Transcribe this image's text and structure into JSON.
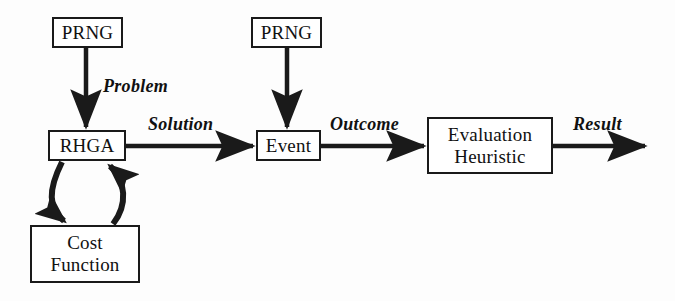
{
  "diagram": {
    "background_color": "#fdfdfd",
    "stroke_color": "#1a1a1a",
    "text_color": "#111111",
    "nodes": [
      {
        "id": "prng-1",
        "lines": [
          "PRNG"
        ],
        "x": 52,
        "y": 17,
        "w": 71,
        "h": 31
      },
      {
        "id": "prng-2",
        "lines": [
          "PRNG"
        ],
        "x": 251,
        "y": 17,
        "w": 71,
        "h": 31
      },
      {
        "id": "rhga",
        "lines": [
          "RHGA"
        ],
        "x": 48,
        "y": 130,
        "w": 78,
        "h": 31
      },
      {
        "id": "event",
        "lines": [
          "Event"
        ],
        "x": 256,
        "y": 130,
        "w": 65,
        "h": 31
      },
      {
        "id": "eval",
        "lines": [
          "Evaluation",
          "Heuristic"
        ],
        "x": 427,
        "y": 117,
        "w": 126,
        "h": 57
      },
      {
        "id": "cost",
        "lines": [
          "Cost",
          "Function"
        ],
        "x": 30,
        "y": 225,
        "w": 110,
        "h": 58
      }
    ],
    "node_labels": {
      "prng_1": "PRNG",
      "prng_2": "PRNG",
      "rhga": "RHGA",
      "event": "Event",
      "eval_line_1": "Evaluation",
      "eval_line_2": "Heuristic",
      "cost_line_1": "Cost",
      "cost_line_2": "Function"
    },
    "edge_labels": {
      "problem": "Problem",
      "solution": "Solution",
      "outcome": "Outcome",
      "result": "Result"
    },
    "edges": [
      {
        "id": "prng1-to-rhga",
        "from": "prng-1",
        "to": "rhga",
        "label": "Problem",
        "kind": "vertical-arrow"
      },
      {
        "id": "rhga-to-event",
        "from": "rhga",
        "to": "event",
        "label": "Solution",
        "kind": "horizontal-arrow"
      },
      {
        "id": "prng2-to-event",
        "from": "prng-2",
        "to": "event",
        "label": "",
        "kind": "vertical-arrow"
      },
      {
        "id": "event-to-eval",
        "from": "event",
        "to": "eval",
        "label": "Outcome",
        "kind": "horizontal-arrow"
      },
      {
        "id": "eval-to-output",
        "from": "eval",
        "to": "",
        "label": "Result",
        "kind": "horizontal-arrow"
      },
      {
        "id": "rhga-to-cost",
        "from": "rhga",
        "to": "cost",
        "label": "",
        "kind": "curved-arrow-down"
      },
      {
        "id": "cost-to-rhga",
        "from": "cost",
        "to": "rhga",
        "label": "",
        "kind": "curved-arrow-up"
      }
    ]
  }
}
